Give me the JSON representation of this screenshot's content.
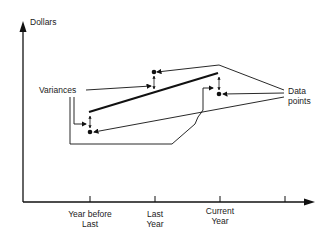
{
  "axes": {
    "y_label": "Dollars",
    "x_ticks": [
      {
        "line1": "Year before",
        "line2": "Last"
      },
      {
        "line1": "Last",
        "line2": "Year"
      },
      {
        "line1": "Current",
        "line2": "Year"
      }
    ]
  },
  "annotations": {
    "variances": "Variances",
    "data_points_line1": "Data",
    "data_points_line2": "points"
  },
  "colors": {
    "ink": "#111111",
    "background": "#ffffff"
  }
}
